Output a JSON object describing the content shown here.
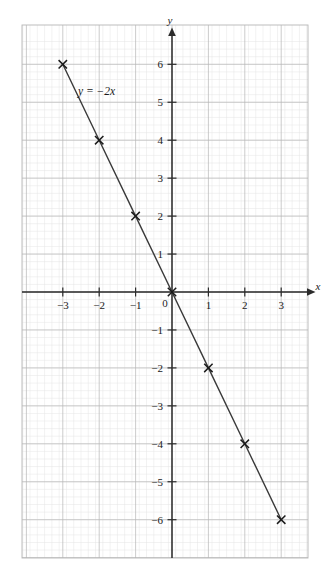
{
  "figure": {
    "kind": "cartesian-line-graph",
    "background": "#ffffff"
  },
  "chart_data": {
    "type": "line",
    "title": "",
    "subtitle": "",
    "xlabel": "x",
    "ylabel": "y",
    "equation": "y = −2x",
    "annotation": "y = −2x",
    "grid": true,
    "grid_major_step": 1,
    "grid_minor_divisions": 5,
    "legend": "none",
    "xlim": [
      -4.1,
      3.75
    ],
    "ylim": [
      -7.0,
      6.8
    ],
    "xticks": [
      -3,
      -2,
      -1,
      0,
      1,
      2,
      3
    ],
    "xtick_labels": [
      "−3",
      "−2",
      "−1",
      "0",
      "1",
      "2",
      "3"
    ],
    "yticks": [
      6,
      5,
      4,
      3,
      2,
      1,
      -1,
      -2,
      -3,
      -4,
      -5,
      -6
    ],
    "ytick_labels": [
      "6",
      "5",
      "4",
      "3",
      "2",
      "1",
      "−1",
      "−2",
      "−3",
      "−4",
      "−5",
      "−6"
    ],
    "series": [
      {
        "name": "y = −2x",
        "marker": "x",
        "x": [
          -3,
          -2,
          -1,
          0,
          1,
          2,
          3
        ],
        "y": [
          6,
          4,
          2,
          0,
          -2,
          -4,
          -6
        ]
      }
    ],
    "axis_arrows": [
      "x-positive",
      "y-positive"
    ],
    "colors": {
      "line": "#3a3a3a",
      "marker": "#1a1a1a",
      "axis": "#2b2b2b",
      "grid_major": "#b4b4b4",
      "grid_minor": "#e2e2e2",
      "frame": "#b4b4b4",
      "text": "#1a1a1a"
    }
  },
  "labels": {
    "x_axis_name": "x",
    "y_axis_name": "y",
    "equation_text": "y = −2x",
    "origin_label": "0"
  },
  "ticks": {
    "x": [
      {
        "value": -3,
        "label": "−3"
      },
      {
        "value": -2,
        "label": "−2"
      },
      {
        "value": -1,
        "label": "−1"
      },
      {
        "value": 1,
        "label": "1"
      },
      {
        "value": 2,
        "label": "2"
      },
      {
        "value": 3,
        "label": "3"
      }
    ],
    "y": [
      {
        "value": 6,
        "label": "6"
      },
      {
        "value": 5,
        "label": "5"
      },
      {
        "value": 4,
        "label": "4"
      },
      {
        "value": 3,
        "label": "3"
      },
      {
        "value": 2,
        "label": "2"
      },
      {
        "value": 1,
        "label": "1"
      },
      {
        "value": -1,
        "label": "−1"
      },
      {
        "value": -2,
        "label": "−2"
      },
      {
        "value": -3,
        "label": "−3"
      },
      {
        "value": -4,
        "label": "−4"
      },
      {
        "value": -5,
        "label": "−5"
      },
      {
        "value": -6,
        "label": "−6"
      }
    ]
  }
}
